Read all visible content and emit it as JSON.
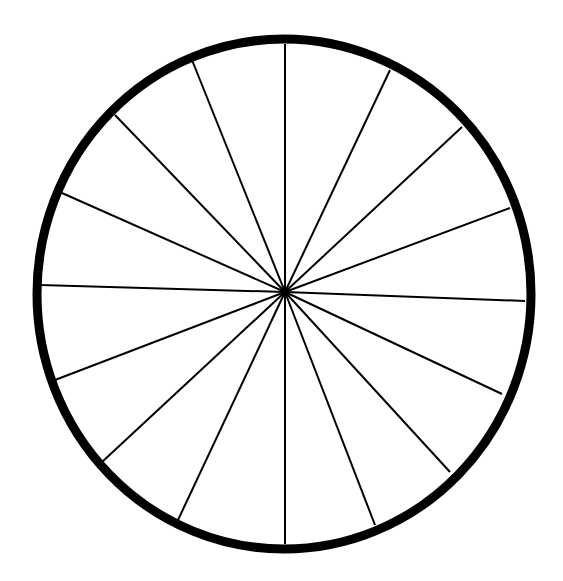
{
  "diagram": {
    "type": "divided-circle",
    "center": [
      285,
      292
    ],
    "radius": 246,
    "rim_width": 9,
    "stroke_color": "#000000",
    "background": "#ffffff",
    "sector_count": 16,
    "spoke_endpoints": [
      [
        285,
        44
      ],
      [
        390,
        70
      ],
      [
        462,
        127
      ],
      [
        510,
        208
      ],
      [
        525,
        301
      ],
      [
        502,
        394
      ],
      [
        450,
        472
      ],
      [
        375,
        525
      ],
      [
        285,
        544
      ],
      [
        178,
        520
      ],
      [
        102,
        462
      ],
      [
        55,
        380
      ],
      [
        40,
        285
      ],
      [
        62,
        193
      ],
      [
        115,
        115
      ],
      [
        192,
        60
      ]
    ]
  }
}
